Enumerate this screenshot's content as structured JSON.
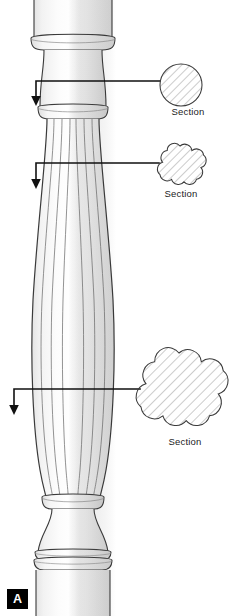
{
  "figure": {
    "plate_label": "A",
    "background_color": "#ffffff",
    "line_color": "#333333",
    "leader_color": "#111111",
    "hatch_color": "#8a8a8a",
    "shade_light": "#fbfbfb",
    "shade_mid": "#ededed",
    "shade_dark": "#dcdcdc"
  },
  "callouts": [
    {
      "id": "section-1",
      "label": "Section",
      "shape": "circle",
      "lobes": 0,
      "center_x": 181,
      "center_y": 85,
      "radius": 21,
      "leader_y": 81,
      "leader_left_x": 36,
      "arrow_y": 103
    },
    {
      "id": "section-2",
      "label": "Section",
      "shape": "scalloped",
      "lobes": 8,
      "center_x": 180,
      "center_y": 167,
      "radius": 21,
      "leader_y": 163,
      "leader_left_x": 36,
      "arrow_y": 186
    },
    {
      "id": "section-3",
      "label": "Section",
      "shape": "scalloped",
      "lobes": 8,
      "center_x": 179,
      "center_y": 393,
      "radius": 40,
      "leader_y": 389,
      "leader_left_x": 14,
      "arrow_y": 412
    }
  ],
  "baluster": {
    "name": "fluted turned baluster",
    "flute_count": 7,
    "top_shaft": {
      "top": 0,
      "bottom": 36,
      "left": 34,
      "right": 112
    },
    "upper_collar": {
      "top": 36,
      "bottom": 46
    },
    "cove_neck": {
      "top": 46,
      "bottom": 93
    },
    "neck_shaft": {
      "top": 93,
      "bottom": 107
    },
    "astragal_ring": {
      "top": 107,
      "bottom": 118
    },
    "fluted_body": {
      "top": 118,
      "bottom": 497
    },
    "body_max_width_y": 320,
    "lower_ring": {
      "top": 497,
      "bottom": 509
    },
    "base_cove": {
      "top": 509,
      "bottom": 552
    },
    "base_rings": {
      "top": 552,
      "bottom": 570
    },
    "bottom_shaft": {
      "top": 570,
      "bottom": 616
    }
  }
}
